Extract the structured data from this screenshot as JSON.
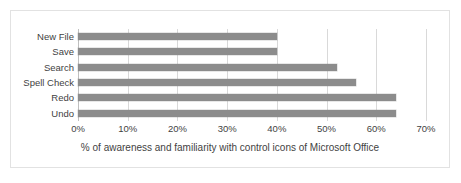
{
  "chart_data": {
    "type": "bar",
    "orientation": "horizontal",
    "title": "",
    "xlabel": "% of awareness and familiarity with control icons of Microsoft Office",
    "ylabel": "",
    "categories": [
      "New File",
      "Save",
      "Search",
      "Spell Check",
      "Redo",
      "Undo"
    ],
    "values": [
      40,
      40,
      52,
      56,
      64,
      64
    ],
    "series": [
      {
        "name": "% of awareness and familiarity",
        "values": [
          40,
          40,
          52,
          56,
          64,
          64
        ]
      }
    ],
    "xlim": [
      0,
      70
    ],
    "xticks": [
      0,
      10,
      20,
      30,
      40,
      50,
      60,
      70
    ],
    "xtick_labels": [
      "0%",
      "10%",
      "20%",
      "30%",
      "40%",
      "50%",
      "60%",
      "70%"
    ],
    "grid": "vertical",
    "legend": "none",
    "bar_color": "#8c8c8c",
    "gridline_color": "#d9d9d9",
    "border_color": "#e2e2e2",
    "text_color": "#3f3f3f"
  },
  "caption": {
    "text": "% of awareness and familiarity with control icons of Microsoft Office"
  }
}
